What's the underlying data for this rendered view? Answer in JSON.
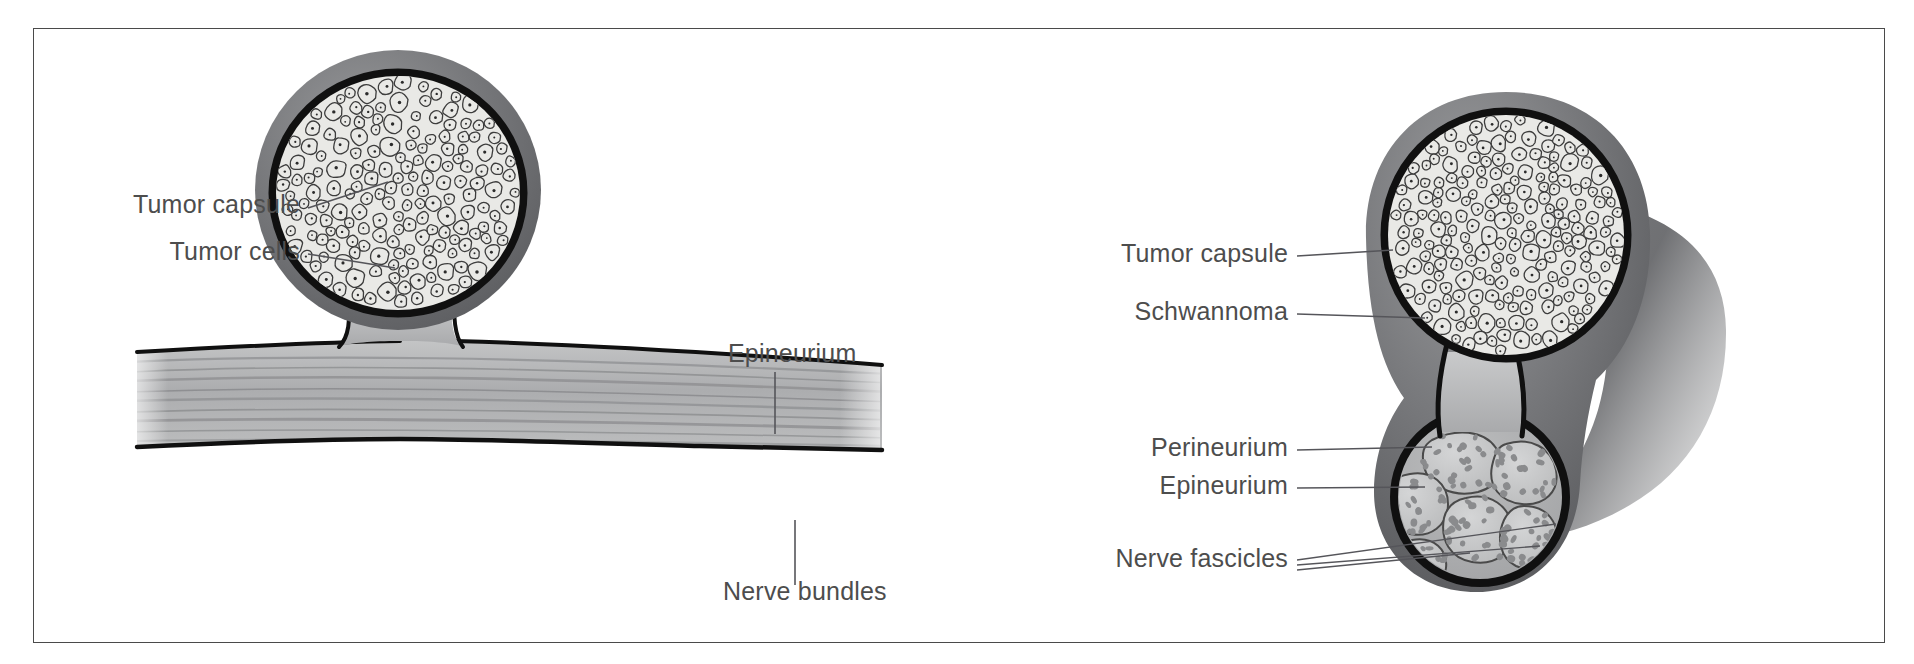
{
  "figure": {
    "background_color": "#ffffff",
    "frame_color": "#4a4a4a",
    "label_color": "#4d4d4d",
    "leader_color": "#55555a"
  },
  "palette": {
    "capsule_outline": "#121212",
    "epineurium_gray": "#6f7072",
    "epineurium_gray_dark": "#5b5c5e",
    "epineurium_gray_light": "#8e8f91",
    "tumor_cell_fill": "#e9e9e6",
    "tumor_cell_outline": "#3a3a3a",
    "tumor_nucleus": "#2a2a2a",
    "fascicle_fill": "#c9cacb",
    "fascicle_outline": "#4a4a4a",
    "axon_dot": "#8a8b8d",
    "nerve_fiber_stripe": "#8d8e90",
    "nerve_fill": "#b9babb"
  },
  "panels": [
    {
      "id": "left",
      "name": "schwannoma-arising-from-nerve-trunk",
      "labels": [
        {
          "id": "tumor-capsule",
          "text": "Tumor capsule",
          "x": 300,
          "y": 213,
          "anchor": "end",
          "leader": {
            "type": "line",
            "x1": 308,
            "y1": 208,
            "x2": 388,
            "y2": 182
          }
        },
        {
          "id": "tumor-cells",
          "text": "Tumor cells",
          "x": 300,
          "y": 260,
          "anchor": "end",
          "leader": {
            "type": "line",
            "x1": 308,
            "y1": 254,
            "x2": 395,
            "y2": 268
          }
        },
        {
          "id": "epineurium",
          "text": "Epineurium",
          "x": 728,
          "y": 362,
          "anchor": "start",
          "leader": {
            "type": "line",
            "x1": 775,
            "y1": 372,
            "x2": 775,
            "y2": 434
          }
        },
        {
          "id": "nerve-bundles",
          "text": "Nerve bundles",
          "x": 723,
          "y": 600,
          "anchor": "start",
          "leader": {
            "type": "line",
            "x1": 795,
            "y1": 585,
            "x2": 795,
            "y2": 520
          }
        }
      ]
    },
    {
      "id": "right",
      "name": "schwannoma-displacing-nerve-fascicles",
      "labels": [
        {
          "id": "tumor-capsule",
          "text": "Tumor capsule",
          "x": 1288,
          "y": 262,
          "anchor": "end",
          "leader": {
            "type": "line",
            "x1": 1297,
            "y1": 256,
            "x2": 1393,
            "y2": 250
          }
        },
        {
          "id": "schwannoma",
          "text": "Schwannoma",
          "x": 1288,
          "y": 320,
          "anchor": "end",
          "leader": {
            "type": "line",
            "x1": 1297,
            "y1": 314,
            "x2": 1425,
            "y2": 318
          }
        },
        {
          "id": "perineurium",
          "text": "Perineurium",
          "x": 1288,
          "y": 456,
          "anchor": "end",
          "leader": {
            "type": "line",
            "x1": 1297,
            "y1": 450,
            "x2": 1432,
            "y2": 447
          }
        },
        {
          "id": "epineurium",
          "text": "Epineurium",
          "x": 1288,
          "y": 494,
          "anchor": "end",
          "leader": {
            "type": "line",
            "x1": 1297,
            "y1": 488,
            "x2": 1425,
            "y2": 487
          }
        },
        {
          "id": "nerve-fascicles",
          "text": "Nerve fascicles",
          "x": 1288,
          "y": 567,
          "anchor": "end",
          "leader": {
            "type": "fan",
            "x1": 1297,
            "ys": [
              560,
              565,
              570
            ],
            "targets": [
              [
                1556,
                524
              ],
              [
                1540,
                546
              ],
              [
                1470,
                553
              ]
            ]
          }
        }
      ]
    }
  ]
}
